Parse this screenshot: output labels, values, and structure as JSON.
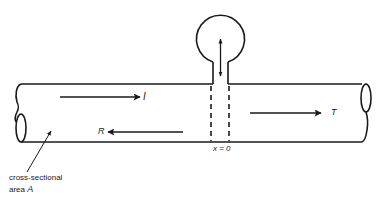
{
  "diagram": {
    "type": "pipe-with-side-resonator",
    "colors": {
      "stroke": "#1a1a1a",
      "background": "#ffffff"
    },
    "labels": {
      "incident": "I",
      "reflected": "R",
      "transmitted": "T",
      "position": "x = 0",
      "area_line1": "cross-sectional",
      "area_line2_prefix": "area ",
      "area_symbol": "A"
    },
    "elements": [
      {
        "name": "main-pipe",
        "description": "horizontal tube with cut ends"
      },
      {
        "name": "side-branch-resonator",
        "description": "spherical bulb with neck at x=0"
      },
      {
        "name": "incident-wave-arrow",
        "direction": "right",
        "label": "I"
      },
      {
        "name": "reflected-wave-arrow",
        "direction": "left",
        "label": "R"
      },
      {
        "name": "transmitted-wave-arrow",
        "direction": "right",
        "label": "T"
      },
      {
        "name": "neck-oscillation-arrow",
        "direction": "up-down"
      }
    ]
  }
}
